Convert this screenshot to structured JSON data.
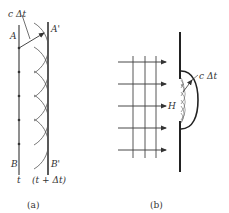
{
  "diagram_a": {
    "caption": "(a)",
    "label_c_dt": "c Δt",
    "label_A": "A",
    "label_A_prime": "A'",
    "label_B": "B",
    "label_B_prime": "B'",
    "label_t": "t",
    "label_t_dt": "(t + Δt)"
  },
  "diagram_b": {
    "caption": "(b)",
    "label_H": "H",
    "label_c_dt": "c Δt"
  },
  "colors": {
    "line": "#333333",
    "thin": "#555555",
    "background": "#ffffff"
  }
}
